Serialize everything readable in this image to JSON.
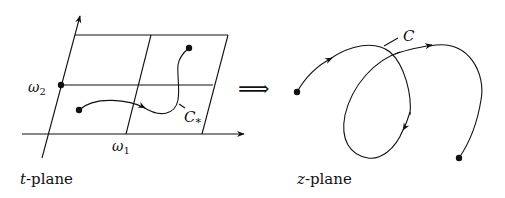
{
  "diagram": {
    "left_panel": {
      "plane_label_var": "t",
      "plane_label_suffix": "-plane",
      "omega1": "ω",
      "omega1_sub": "1",
      "omega2": "ω",
      "omega2_sub": "2",
      "curve_label": "C",
      "curve_label_sub": "*"
    },
    "mapping_arrow": "⟹",
    "right_panel": {
      "plane_label_var": "z",
      "plane_label_suffix": "-plane",
      "curve_label": "C"
    }
  }
}
